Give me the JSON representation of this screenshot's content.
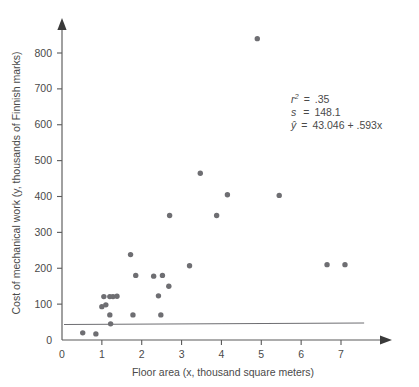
{
  "chart_data": {
    "type": "scatter",
    "title": "",
    "xlabel": "Floor area (x, thousand square meters)",
    "ylabel": "Cost of mechanical work (y, thousands of Finnish marks)",
    "xlim": [
      0,
      7.6
    ],
    "ylim": [
      0,
      880
    ],
    "xticks": [
      0,
      1,
      2,
      3,
      4,
      5,
      6,
      7
    ],
    "xtick_labels": [
      "0",
      "1",
      "2",
      "3",
      "4",
      "5",
      "6",
      "7"
    ],
    "yticks": [
      0,
      100,
      200,
      300,
      400,
      500,
      600,
      700,
      800
    ],
    "ytick_labels": [
      "0",
      "100",
      "200",
      "300",
      "400",
      "500",
      "600",
      "700",
      "800"
    ],
    "grid": false,
    "legend": null,
    "marker_color": "#6e6e72",
    "line_color": "#6e6e72",
    "points": [
      {
        "x": 0.52,
        "y": 20
      },
      {
        "x": 0.85,
        "y": 17
      },
      {
        "x": 1.0,
        "y": 93
      },
      {
        "x": 1.05,
        "y": 121
      },
      {
        "x": 1.1,
        "y": 98
      },
      {
        "x": 1.2,
        "y": 121
      },
      {
        "x": 1.2,
        "y": 70
      },
      {
        "x": 1.22,
        "y": 45
      },
      {
        "x": 1.28,
        "y": 121
      },
      {
        "x": 1.38,
        "y": 122
      },
      {
        "x": 1.72,
        "y": 238
      },
      {
        "x": 1.78,
        "y": 70
      },
      {
        "x": 1.85,
        "y": 180
      },
      {
        "x": 2.3,
        "y": 178
      },
      {
        "x": 2.42,
        "y": 123
      },
      {
        "x": 2.48,
        "y": 70
      },
      {
        "x": 2.52,
        "y": 180
      },
      {
        "x": 2.68,
        "y": 150
      },
      {
        "x": 2.7,
        "y": 347
      },
      {
        "x": 3.2,
        "y": 207
      },
      {
        "x": 3.47,
        "y": 465
      },
      {
        "x": 3.88,
        "y": 347
      },
      {
        "x": 4.15,
        "y": 405
      },
      {
        "x": 4.9,
        "y": 840
      },
      {
        "x": 5.45,
        "y": 403
      },
      {
        "x": 6.65,
        "y": 210
      },
      {
        "x": 7.1,
        "y": 210
      }
    ],
    "fit_line": {
      "intercept": 43.046,
      "slope": 0.593,
      "x_start": 0.05,
      "x_end": 7.58
    },
    "annotations": {
      "r_squared_symbol": "r",
      "r_squared_exponent": "2",
      "r_squared_equals": "=",
      "r_squared_value": ".35",
      "s_symbol": "s",
      "s_equals": "=",
      "s_value": "148.1",
      "yhat_symbol": "ŷ",
      "yhat_equals": "=",
      "yhat_value": "43.046 + .593x"
    }
  }
}
